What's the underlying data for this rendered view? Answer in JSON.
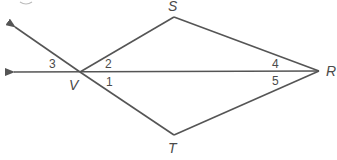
{
  "figure": {
    "stroke_color": "#555555",
    "points": {
      "V": {
        "label": "V",
        "x": 80,
        "y": 72
      },
      "S": {
        "label": "S",
        "x": 174,
        "y": 17
      },
      "R": {
        "label": "R",
        "x": 319,
        "y": 71
      },
      "T": {
        "label": "T",
        "x": 174,
        "y": 135
      }
    },
    "angles": {
      "a1": "1",
      "a2": "2",
      "a3": "3",
      "a4": "4",
      "a5": "5"
    },
    "rays": [
      {
        "from": "V",
        "direction": "left",
        "arrow": true
      },
      {
        "from": "V",
        "direction": "upper-left",
        "arrow": true
      }
    ]
  }
}
